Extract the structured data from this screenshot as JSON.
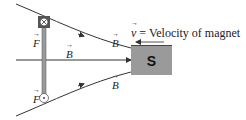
{
  "diagram": {
    "labels": {
      "force_top": "F",
      "force_bottom": "F",
      "field_top": "B",
      "field_middle": "B",
      "field_bottom": "B"
    },
    "velocity_label": {
      "symbol": "v",
      "text": " = Velocity of magnet"
    },
    "magnet": {
      "pole": "S",
      "color": "#9a9a9a"
    },
    "current_symbols": {
      "top": "into-page",
      "bottom": "out-of-page"
    },
    "colors": {
      "line": "#333333",
      "rod": "#8a8a8a",
      "background": "#ffffff"
    }
  }
}
